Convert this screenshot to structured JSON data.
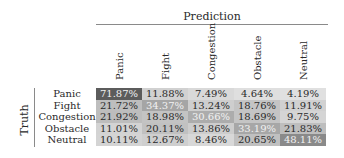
{
  "chart_data": {
    "type": "heatmap",
    "title": "",
    "xlabel": "Prediction",
    "ylabel": "Truth",
    "x_categories": [
      "Panic",
      "Fight",
      "Congestion",
      "Obstacle",
      "Neutral"
    ],
    "y_categories": [
      "Panic",
      "Fight",
      "Congestion",
      "Obstacle",
      "Neutral"
    ],
    "values": [
      [
        71.87,
        11.88,
        7.49,
        4.64,
        4.19
      ],
      [
        21.72,
        34.37,
        13.24,
        18.76,
        11.91
      ],
      [
        21.92,
        18.98,
        30.66,
        18.69,
        9.75
      ],
      [
        11.01,
        20.11,
        13.86,
        33.19,
        21.83
      ],
      [
        10.11,
        12.67,
        8.46,
        20.65,
        48.11
      ]
    ],
    "labels": [
      [
        "71.87%",
        "11.88%",
        "7.49%",
        "4.64%",
        "4.19%"
      ],
      [
        "21.72%",
        "34.37%",
        "13.24%",
        "18.76%",
        "11.91%"
      ],
      [
        "21.92%",
        "18.98%",
        "30.66%",
        "18.69%",
        "9.75%"
      ],
      [
        "11.01%",
        "20.11%",
        "13.86%",
        "33.19%",
        "21.83%"
      ],
      [
        "10.11%",
        "12.67%",
        "8.46%",
        "20.65%",
        "48.11%"
      ]
    ],
    "colormap": "grayscale (darker = higher)",
    "grid": false,
    "legend": "none"
  },
  "header": {
    "prediction": "Prediction",
    "truth": "Truth"
  }
}
